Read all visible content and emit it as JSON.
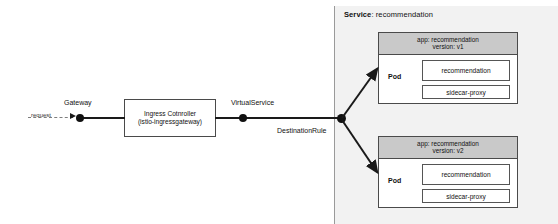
{
  "diagram": {
    "colors": {
      "panel_background": "#f2f2f2",
      "pod_header_background": "#c9c9c9",
      "line": "#1a1a1a",
      "dashed_line": "#7d7d7d",
      "box_border": "#4a4a4a"
    }
  },
  "flow": {
    "request_label": "request",
    "gateway_label": "Gateway",
    "virtualservice_label": "VirtualService",
    "destinationrule_label": "DestinationRule"
  },
  "ingress": {
    "line1": "Ingress Cotnroller",
    "line2": "(istio-ingressgateway)"
  },
  "service": {
    "key": "Service",
    "separator": ": ",
    "value": "recommendation"
  },
  "pods": [
    {
      "id": "v1",
      "header_app": "app: recommendation",
      "header_version": "version: v1",
      "pod_label": "Pod",
      "containers": [
        {
          "name": "recommendation"
        },
        {
          "name": "sidecar-proxy"
        }
      ]
    },
    {
      "id": "v2",
      "header_app": "app: recommendation",
      "header_version": "version: v2",
      "pod_label": "Pod",
      "containers": [
        {
          "name": "recommendation"
        },
        {
          "name": "sidecar-proxy"
        }
      ]
    }
  ]
}
